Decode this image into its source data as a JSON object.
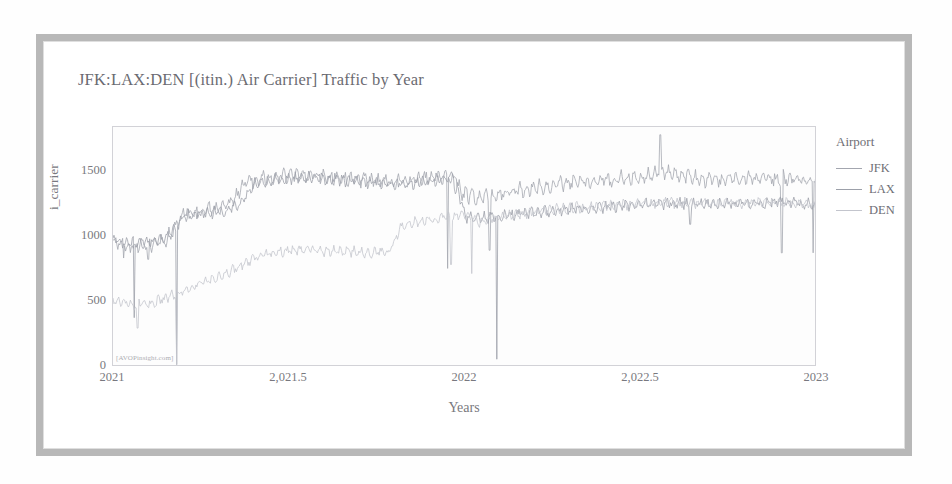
{
  "chart_data": {
    "type": "line",
    "title": "JFK:LAX:DEN [(itin.) Air Carrier] Traffic by Year",
    "xlabel": "Years",
    "ylabel": "i_carrier",
    "xlim": [
      2021.0,
      2023.0
    ],
    "ylim": [
      0,
      1850
    ],
    "grid": false,
    "legend_title": "Airport",
    "legend_position": "right",
    "watermark": "[AVOPinsight.com]",
    "x_ticks": [
      2021,
      2021.5,
      2022,
      2022.5,
      2023
    ],
    "x_tick_labels": [
      "2021",
      "2,021.5",
      "2022",
      "2,022.5",
      "2023"
    ],
    "y_ticks": [
      0,
      500,
      1000,
      1500
    ],
    "y_tick_labels": [
      "0",
      "500",
      "1000",
      "1500"
    ],
    "series": [
      {
        "name": "JFK",
        "color": "#8f939e",
        "anchors": [
          [
            2021.0,
            960
          ],
          [
            2021.05,
            930
          ],
          [
            2021.1,
            945
          ],
          [
            2021.15,
            975
          ],
          [
            2021.2,
            1180
          ],
          [
            2021.25,
            1195
          ],
          [
            2021.3,
            1215
          ],
          [
            2021.33,
            1250
          ],
          [
            2021.38,
            1430
          ],
          [
            2021.45,
            1460
          ],
          [
            2021.5,
            1480
          ],
          [
            2021.58,
            1470
          ],
          [
            2021.65,
            1455
          ],
          [
            2021.72,
            1440
          ],
          [
            2021.8,
            1430
          ],
          [
            2021.88,
            1450
          ],
          [
            2021.95,
            1465
          ],
          [
            2022.0,
            1330
          ],
          [
            2022.05,
            1300
          ],
          [
            2022.12,
            1345
          ],
          [
            2022.2,
            1390
          ],
          [
            2022.3,
            1415
          ],
          [
            2022.4,
            1445
          ],
          [
            2022.5,
            1470
          ],
          [
            2022.56,
            1500
          ],
          [
            2022.62,
            1480
          ],
          [
            2022.7,
            1440
          ],
          [
            2022.8,
            1450
          ],
          [
            2022.9,
            1455
          ],
          [
            2023.0,
            1440
          ]
        ],
        "noise": 58,
        "spike_days": [
          [
            2022.555,
            1790
          ]
        ],
        "drop_days": [
          [
            2021.03,
            840
          ],
          [
            2021.1,
            830
          ],
          [
            2021.95,
            760
          ],
          [
            2022.07,
            900
          ],
          [
            2022.9,
            880
          ],
          [
            2022.99,
            880
          ]
        ]
      },
      {
        "name": "LAX",
        "color": "#878b96",
        "anchors": [
          [
            2021.0,
            980
          ],
          [
            2021.05,
            950
          ],
          [
            2021.1,
            965
          ],
          [
            2021.16,
            1010
          ],
          [
            2021.2,
            1170
          ],
          [
            2021.26,
            1185
          ],
          [
            2021.32,
            1210
          ],
          [
            2021.36,
            1245
          ],
          [
            2021.4,
            1420
          ],
          [
            2021.48,
            1450
          ],
          [
            2021.55,
            1465
          ],
          [
            2021.62,
            1450
          ],
          [
            2021.7,
            1430
          ],
          [
            2021.78,
            1420
          ],
          [
            2021.85,
            1415
          ],
          [
            2021.92,
            1450
          ],
          [
            2021.97,
            1470
          ],
          [
            2022.0,
            1160
          ],
          [
            2022.06,
            1150
          ],
          [
            2022.14,
            1175
          ],
          [
            2022.22,
            1200
          ],
          [
            2022.32,
            1215
          ],
          [
            2022.42,
            1235
          ],
          [
            2022.52,
            1250
          ],
          [
            2022.6,
            1265
          ],
          [
            2022.7,
            1255
          ],
          [
            2022.8,
            1260
          ],
          [
            2022.9,
            1270
          ],
          [
            2023.0,
            1250
          ]
        ],
        "noise": 44,
        "spike_days": [],
        "drop_days": [
          [
            2021.06,
            380
          ],
          [
            2021.18,
            20
          ],
          [
            2022.09,
            60
          ],
          [
            2022.64,
            1100
          ]
        ]
      },
      {
        "name": "DEN",
        "color": "#b6b9c2",
        "anchors": [
          [
            2021.0,
            520
          ],
          [
            2021.06,
            480
          ],
          [
            2021.12,
            500
          ],
          [
            2021.18,
            560
          ],
          [
            2021.24,
            640
          ],
          [
            2021.3,
            690
          ],
          [
            2021.36,
            780
          ],
          [
            2021.42,
            860
          ],
          [
            2021.48,
            890
          ],
          [
            2021.54,
            905
          ],
          [
            2021.6,
            895
          ],
          [
            2021.66,
            890
          ],
          [
            2021.72,
            885
          ],
          [
            2021.78,
            880
          ],
          [
            2021.82,
            1090
          ],
          [
            2021.88,
            1130
          ],
          [
            2021.94,
            1150
          ],
          [
            2022.0,
            1180
          ],
          [
            2022.04,
            1120
          ],
          [
            2022.1,
            1150
          ],
          [
            2022.18,
            1190
          ],
          [
            2022.26,
            1215
          ],
          [
            2022.36,
            1240
          ],
          [
            2022.46,
            1255
          ],
          [
            2022.56,
            1270
          ],
          [
            2022.66,
            1260
          ],
          [
            2022.76,
            1265
          ],
          [
            2022.86,
            1270
          ],
          [
            2022.96,
            1255
          ],
          [
            2023.0,
            1240
          ]
        ],
        "noise": 40,
        "spike_days": [],
        "drop_days": [
          [
            2021.07,
            300
          ],
          [
            2021.18,
            15
          ],
          [
            2021.96,
            790
          ],
          [
            2022.02,
            720
          ]
        ]
      }
    ]
  },
  "frame": {
    "border_color": "#a9a9a9"
  }
}
